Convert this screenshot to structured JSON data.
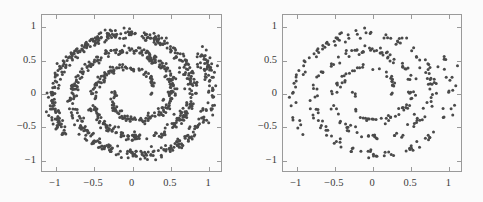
{
  "figure": {
    "background_color": "#fbfbfb",
    "panel_count": 2,
    "frame_color": "#9a9a9a",
    "point_color": "#4a4a4a"
  },
  "chart_data": [
    {
      "type": "scatter",
      "title": "",
      "subtitle": "",
      "xlabel": "",
      "ylabel": "",
      "panel_label": "left",
      "description": "Dense two-armed Archimedean spiral point cloud",
      "xlim": [
        -1.18,
        1.18
      ],
      "ylim": [
        -1.18,
        1.18
      ],
      "xticks": [
        -1,
        -0.5,
        0,
        0.5,
        1
      ],
      "yticks": [
        -1,
        -0.5,
        0,
        0.5,
        1
      ],
      "xticklabels": [
        "−1",
        "−0.5",
        "0",
        "0.5",
        "1"
      ],
      "yticklabels": [
        "−1",
        "−0.5",
        "0",
        "0.5",
        "1"
      ],
      "grid": false,
      "legend": null,
      "n_points": 1000,
      "marker_size": 1.5,
      "marker_color": "#4a4a4a",
      "generator": {
        "kind": "two_arm_archimedean_spiral",
        "arms": 2,
        "turns": 2.1,
        "t_min": 0.22,
        "t_max": 1.0,
        "radius_max": 1.08,
        "noise_sigma": 0.035,
        "seed": 17
      }
    },
    {
      "type": "scatter",
      "title": "",
      "subtitle": "",
      "xlabel": "",
      "ylabel": "",
      "panel_label": "right",
      "description": "Sparse subsample of the same two-armed spiral point cloud",
      "xlim": [
        -1.18,
        1.18
      ],
      "ylim": [
        -1.18,
        1.18
      ],
      "xticks": [
        -1,
        -0.5,
        0,
        0.5,
        1
      ],
      "yticks": [
        -1,
        -0.5,
        0,
        0.5,
        1
      ],
      "xticklabels": [
        "−1",
        "−0.5",
        "0",
        "0.5",
        "1"
      ],
      "yticklabels": [
        "−1",
        "−0.5",
        "0",
        "0.5",
        "1"
      ],
      "grid": false,
      "legend": null,
      "n_points": 330,
      "marker_size": 1.5,
      "marker_color": "#4a4a4a",
      "generator": {
        "kind": "two_arm_archimedean_spiral",
        "arms": 2,
        "turns": 2.1,
        "t_min": 0.22,
        "t_max": 1.0,
        "radius_max": 1.08,
        "noise_sigma": 0.035,
        "seed": 17
      }
    }
  ]
}
